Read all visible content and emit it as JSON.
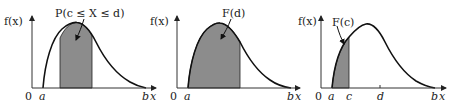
{
  "figure": {
    "panels": [
      {
        "id": "panel-1",
        "y_axis_label": "f(x)",
        "origin_label": "0",
        "x_axis_label": "x",
        "x_ticks": [
          {
            "label": "a"
          },
          {
            "label": "b"
          }
        ],
        "annotation": "P(c ≤ X ≤ d)",
        "shaded_region": "between c and d"
      },
      {
        "id": "panel-2",
        "y_axis_label": "f(x)",
        "origin_label": "0",
        "x_axis_label": "x",
        "x_ticks": [
          {
            "label": "a"
          },
          {
            "label": "b"
          }
        ],
        "annotation": "F(d)",
        "shaded_region": "from a to d"
      },
      {
        "id": "panel-3",
        "y_axis_label": "f(x)",
        "origin_label": "0",
        "x_axis_label": "x",
        "x_ticks": [
          {
            "label": "a"
          },
          {
            "label": "c"
          },
          {
            "label": "d"
          },
          {
            "label": "b"
          }
        ],
        "annotation": "F(c)",
        "shaded_region": "from a to c"
      }
    ]
  },
  "colors": {
    "shade": "#8c8c8c",
    "curve": "#111111",
    "axis": "#333333",
    "background": "#ffffff"
  }
}
